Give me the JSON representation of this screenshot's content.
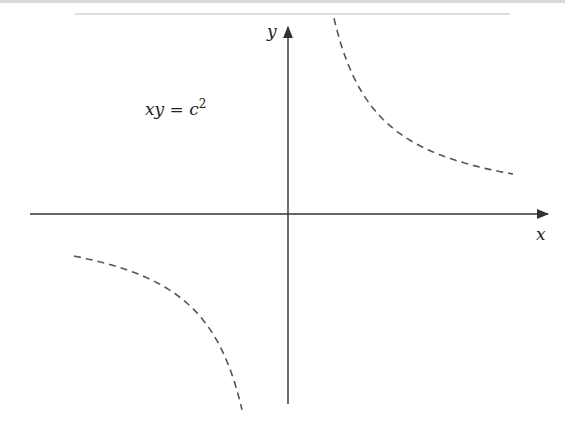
{
  "figure": {
    "equation_label": "xy = c",
    "equation_exponent": "2",
    "x_axis_label": "x",
    "y_axis_label": "y",
    "curve_style": "dashed",
    "colors": {
      "axis": "#333333",
      "curve": "#555555",
      "text": "#222222"
    }
  },
  "geometry": {
    "origin": [
      288,
      214
    ],
    "c_squared_px": 9000
  }
}
